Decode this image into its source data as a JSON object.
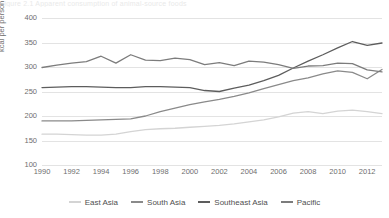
{
  "figure": {
    "title_sliver": "Figure 2.1  Apparent consumption of animal-source foods"
  },
  "chart_data": {
    "type": "line",
    "title": "",
    "xlabel": "",
    "ylabel": "kcal per person per day",
    "xlim": [
      1990,
      2013
    ],
    "ylim": [
      100,
      400
    ],
    "grid": true,
    "legend_position": "bottom",
    "xtick_labels": [
      "1990",
      "1992",
      "1994",
      "1996",
      "1998",
      "2000",
      "2002",
      "2004",
      "2006",
      "2008",
      "2010",
      "2012"
    ],
    "ytick_labels": [
      "400",
      "350",
      "300",
      "250",
      "200",
      "150",
      "100"
    ],
    "x": [
      1990,
      1991,
      1992,
      1993,
      1994,
      1995,
      1996,
      1997,
      1998,
      1999,
      2000,
      2001,
      2002,
      2003,
      2004,
      2005,
      2006,
      2007,
      2008,
      2009,
      2010,
      2011,
      2012,
      2013
    ],
    "series": [
      {
        "name": "East Asia",
        "color": "#d4d4d4",
        "values": [
          163,
          163,
          162,
          161,
          161,
          163,
          168,
          172,
          174,
          175,
          177,
          179,
          181,
          184,
          188,
          192,
          198,
          206,
          209,
          205,
          210,
          212,
          209,
          205
        ]
      },
      {
        "name": "South Asia",
        "color": "#8a8a8a",
        "values": [
          190,
          190,
          190,
          191,
          192,
          193,
          194,
          200,
          209,
          216,
          223,
          229,
          234,
          240,
          247,
          256,
          264,
          272,
          278,
          286,
          292,
          289,
          276,
          295
        ]
      },
      {
        "name": "Southeast Asia",
        "color": "#5d5d5d",
        "values": [
          258,
          259,
          260,
          260,
          259,
          258,
          258,
          260,
          260,
          259,
          258,
          252,
          250,
          257,
          263,
          272,
          283,
          298,
          312,
          325,
          339,
          352,
          344,
          349
        ]
      },
      {
        "name": "Pacific",
        "color": "#7c7c7c",
        "values": [
          299,
          304,
          308,
          311,
          322,
          308,
          325,
          314,
          313,
          318,
          315,
          305,
          309,
          303,
          312,
          310,
          305,
          297,
          302,
          303,
          308,
          307,
          294,
          290
        ]
      }
    ]
  }
}
